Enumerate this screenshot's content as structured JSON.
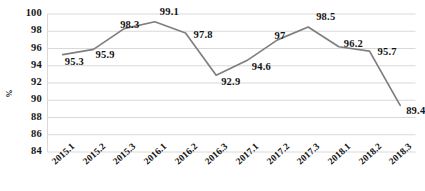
{
  "chart_data": {
    "type": "line",
    "title": "",
    "xlabel": "",
    "ylabel": "%",
    "categories": [
      "2015.1",
      "2015.2",
      "2015.3",
      "2016.1",
      "2016.2",
      "2016.3",
      "2017.1",
      "2017.2",
      "2017.3",
      "2018.1",
      "2018.2",
      "2018.3"
    ],
    "values": [
      95.3,
      95.9,
      98.3,
      99.1,
      97.8,
      92.9,
      94.6,
      97,
      98.5,
      96.2,
      95.7,
      89.4
    ],
    "point_labels": [
      "95.3",
      "95.9",
      "98.3",
      "99.1",
      "97.8",
      "92.9",
      "94.6",
      "97",
      "98.5",
      "96.2",
      "95.7",
      "89.4"
    ],
    "ylim": [
      84,
      100
    ],
    "ytick_values": [
      100,
      98,
      96,
      94,
      92,
      90,
      88,
      86,
      84
    ],
    "ytick_labels": [
      "100",
      "98",
      "96",
      "94",
      "92",
      "90",
      "88",
      "86",
      "84"
    ],
    "grid": true,
    "legend": "none",
    "series": [
      {
        "name": "",
        "values": [
          95.3,
          95.9,
          98.3,
          99.1,
          97.8,
          92.9,
          94.6,
          97,
          98.5,
          96.2,
          95.7,
          89.4
        ]
      }
    ],
    "colors": {
      "line": "#7f7f7f",
      "grid": "#d9d9d9",
      "text": "#151515",
      "background": "#ffffff"
    }
  }
}
